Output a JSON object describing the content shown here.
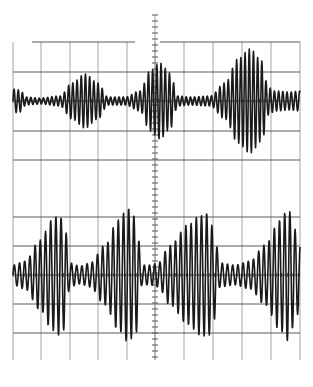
{
  "chart_data": {
    "type": "line",
    "title": "",
    "xlabel": "",
    "ylabel": "",
    "grid": true,
    "legend": null,
    "graticule": {
      "x_left": 13,
      "x_right": 300,
      "y_top": 42,
      "y_bottom": 360,
      "vertical_lines_x": [
        13,
        41,
        70,
        98,
        127,
        155,
        184,
        213,
        242,
        271,
        300
      ],
      "horizontal_lines_y": [
        42,
        72,
        101,
        131,
        160,
        217,
        246,
        275,
        304,
        333
      ],
      "center_axis_x": 155,
      "center_axis_tick_spacing": 6,
      "center_axis_tick_range": [
        15,
        360
      ],
      "top_partial_line_segments": [
        [
          32,
          135
        ],
        [
          160,
          300
        ]
      ]
    },
    "series": [
      {
        "name": "Upper trace",
        "baseline_y": 101,
        "carrier_period_px": 4.2,
        "envelope": {
          "x": [
            13,
            20,
            26,
            40,
            60,
            72,
            85,
            98,
            108,
            125,
            140,
            150,
            160,
            170,
            178,
            190,
            210,
            225,
            238,
            250,
            262,
            268,
            275,
            290,
            300
          ],
          "amp": [
            12,
            11,
            4,
            3,
            5,
            18,
            27,
            18,
            4,
            4,
            10,
            30,
            38,
            28,
            5,
            4,
            5,
            18,
            42,
            52,
            40,
            14,
            10,
            9,
            10
          ]
        },
        "bursts": [
          {
            "center_x": 85,
            "peak_amplitude_px": 27,
            "relative_amplitude": 0.52
          },
          {
            "center_x": 160,
            "peak_amplitude_px": 38,
            "relative_amplitude": 0.73
          },
          {
            "center_x": 250,
            "peak_amplitude_px": 52,
            "relative_amplitude": 1.0
          }
        ]
      },
      {
        "name": "Lower trace",
        "baseline_y": 275,
        "carrier_period_px": 5.2,
        "envelope": {
          "x": [
            13,
            25,
            40,
            52,
            58,
            64,
            70,
            80,
            90,
            105,
            118,
            128,
            136,
            142,
            150,
            158,
            170,
            188,
            200,
            208,
            214,
            220,
            235,
            250,
            265,
            280,
            288,
            296,
            300
          ],
          "amp": [
            10,
            14,
            35,
            55,
            60,
            55,
            12,
            9,
            12,
            30,
            55,
            67,
            58,
            10,
            10,
            12,
            30,
            50,
            60,
            62,
            45,
            12,
            10,
            14,
            30,
            55,
            66,
            45,
            30
          ]
        },
        "bursts": [
          {
            "center_x": 58,
            "peak_amplitude_px": 60,
            "relative_amplitude": 0.9
          },
          {
            "center_x": 128,
            "peak_amplitude_px": 67,
            "relative_amplitude": 1.0
          },
          {
            "center_x": 208,
            "peak_amplitude_px": 62,
            "relative_amplitude": 0.93
          },
          {
            "center_x": 288,
            "peak_amplitude_px": 66,
            "relative_amplitude": 0.98
          }
        ]
      }
    ]
  }
}
